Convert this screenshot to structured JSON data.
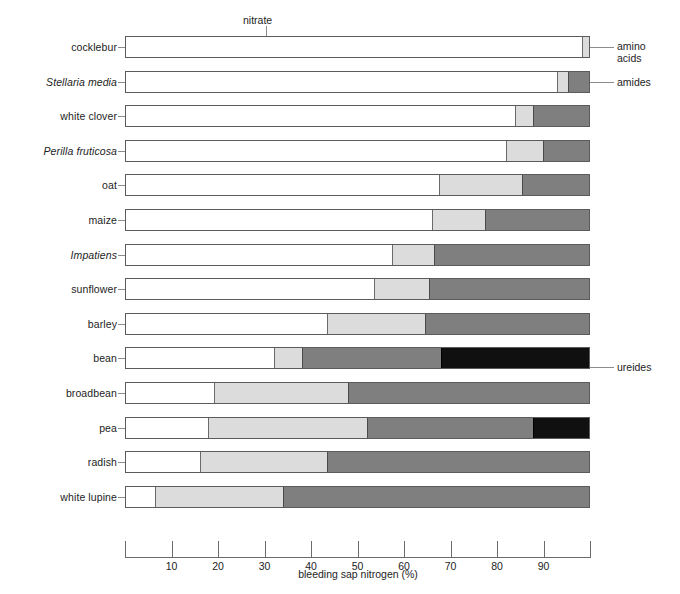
{
  "chart_data": {
    "type": "bar",
    "orientation": "horizontal",
    "stacked": true,
    "title": "",
    "xlabel": "bleeding sap nitrogen (%)",
    "ylabel": "",
    "xlim": [
      0,
      100
    ],
    "xticks": [
      10,
      20,
      30,
      40,
      50,
      60,
      70,
      80,
      90
    ],
    "xtick_labels": [
      "10",
      "20",
      "30",
      "40",
      "50",
      "60",
      "70",
      "80",
      "90"
    ],
    "grid": false,
    "legend_position": "callout",
    "series": [
      {
        "name": "nitrate",
        "color": "#ffffff",
        "values": [
          98.5,
          93.0,
          84.0,
          82.0,
          67.5,
          66.0,
          57.5,
          53.5,
          43.5,
          32.0,
          19.0,
          17.8,
          16.0,
          6.2
        ]
      },
      {
        "name": "amino acids",
        "color": "#dcdcdc",
        "values": [
          1.5,
          2.5,
          4.0,
          8.0,
          18.0,
          11.5,
          9.0,
          12.0,
          21.0,
          6.0,
          29.0,
          34.2,
          27.5,
          27.8
        ]
      },
      {
        "name": "amides",
        "color": "#7f7f7f",
        "values": [
          0.0,
          4.5,
          12.0,
          10.0,
          14.5,
          22.5,
          33.5,
          34.5,
          35.5,
          30.0,
          52.0,
          36.0,
          56.5,
          66.0
        ]
      },
      {
        "name": "ureides",
        "color": "#101010",
        "values": [
          0.0,
          0.0,
          0.0,
          0.0,
          0.0,
          0.0,
          0.0,
          0.0,
          0.0,
          32.0,
          0.0,
          12.0,
          0.0,
          0.0
        ]
      }
    ],
    "categories": [
      {
        "label": "cocklebur",
        "italic": false
      },
      {
        "label": "Stellaria media",
        "italic": true
      },
      {
        "label": "white clover",
        "italic": false
      },
      {
        "label": "Perilla fruticosa",
        "italic": true
      },
      {
        "label": "oat",
        "italic": false
      },
      {
        "label": "maize",
        "italic": false
      },
      {
        "label": "Impatiens",
        "italic": true
      },
      {
        "label": "sunflower",
        "italic": false
      },
      {
        "label": "barley",
        "italic": false
      },
      {
        "label": "bean",
        "italic": false
      },
      {
        "label": "broadbean",
        "italic": false
      },
      {
        "label": "pea",
        "italic": false
      },
      {
        "label": "radish",
        "italic": false
      },
      {
        "label": "white lupine",
        "italic": false
      }
    ],
    "annotations": [
      {
        "name": "nitrate",
        "text": "nitrate",
        "points_to_row": 0,
        "side": "top"
      },
      {
        "name": "amino-acids",
        "text": "amino\nacids",
        "points_to_row": 0,
        "side": "right"
      },
      {
        "name": "amides",
        "text": "amides",
        "points_to_row": 1,
        "side": "right"
      },
      {
        "name": "ureides",
        "text": "ureides",
        "points_to_row": 9,
        "side": "right"
      }
    ]
  },
  "colors": {
    "nitrate": "#ffffff",
    "amino_acids": "#dcdcdc",
    "amides": "#7f7f7f",
    "ureides": "#101010",
    "outline": "#5b5b5b",
    "leader": "#8c8c8c",
    "axis": "#6b6b6b",
    "text": "#1d1d1d"
  }
}
